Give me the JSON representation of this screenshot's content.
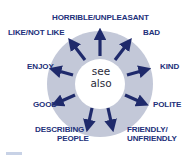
{
  "diagram": {
    "center_text": {
      "line1": "see",
      "line2": "also"
    },
    "colors": {
      "ring": "#c3c8d8",
      "arrow": "#1f2a6b",
      "label": "#22307a",
      "center": "#ffffff"
    },
    "labels": [
      {
        "id": "horrible",
        "text": "HORRIBLE/UNPLEASANT"
      },
      {
        "id": "like",
        "text": "LIKE/NOT LIKE"
      },
      {
        "id": "bad",
        "text": "BAD"
      },
      {
        "id": "enjoy",
        "text": "ENJOY"
      },
      {
        "id": "kind",
        "text": "KIND"
      },
      {
        "id": "good",
        "text": "GOOD"
      },
      {
        "id": "polite",
        "text": "POLITE"
      },
      {
        "id": "describing_1",
        "text": "DESCRIBING"
      },
      {
        "id": "describing_2",
        "text": "PEOPLE"
      },
      {
        "id": "friendly_1",
        "text": "FRIENDLY/"
      },
      {
        "id": "friendly_2",
        "text": "UNFRIENDLY"
      }
    ]
  }
}
